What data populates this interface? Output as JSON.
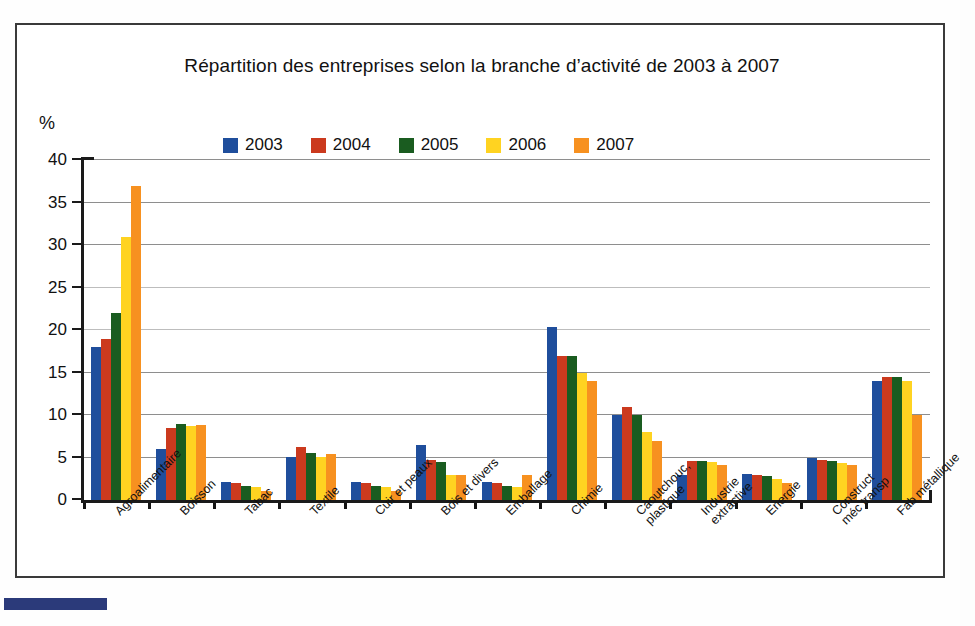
{
  "chart_data": {
    "type": "bar",
    "title": "Répartition des entreprises selon la branche d’activité de 2003 à 2007",
    "xlabel": "",
    "ylabel": "%",
    "ylim": [
      0,
      40
    ],
    "yticks": [
      0,
      5,
      10,
      15,
      20,
      25,
      30,
      35,
      40
    ],
    "grid": true,
    "legend_position": "top",
    "categories": [
      "Agroalimentaire",
      "Boisson",
      "Tabac",
      "Textile",
      "Cuir et peaux",
      "Bois et divers",
      "Emballage",
      "Chimie",
      "Caoutchouc,\nplastique",
      "Industrie\nextractive",
      "Energie",
      "Construct\nméc transp",
      "Fab métallique"
    ],
    "series": [
      {
        "name": "2003",
        "color": "#1F4E9C",
        "values": [
          18.0,
          6.0,
          2.1,
          5.1,
          2.1,
          6.5,
          2.1,
          20.3,
          10.0,
          3.0,
          3.1,
          5.0,
          14.0
        ]
      },
      {
        "name": "2004",
        "color": "#CB3A1E",
        "values": [
          19.0,
          8.5,
          2.0,
          6.2,
          2.0,
          4.7,
          2.0,
          17.0,
          11.0,
          4.6,
          3.0,
          4.7,
          14.5
        ]
      },
      {
        "name": "2005",
        "color": "#1A5C20",
        "values": [
          22.0,
          9.0,
          1.6,
          5.5,
          1.6,
          4.5,
          1.6,
          17.0,
          10.0,
          4.6,
          2.8,
          4.6,
          14.5
        ]
      },
      {
        "name": "2006",
        "color": "#FFD321",
        "values": [
          31.0,
          8.7,
          1.5,
          5.1,
          1.5,
          3.0,
          1.5,
          15.0,
          8.0,
          4.5,
          2.5,
          4.4,
          14.0
        ]
      },
      {
        "name": "2007",
        "color": "#F79120",
        "values": [
          37.0,
          8.8,
          1.1,
          5.4,
          1.1,
          2.9,
          3.0,
          14.0,
          7.0,
          4.1,
          2.0,
          4.1,
          10.0
        ]
      }
    ]
  },
  "legend": {
    "items": [
      {
        "label": "2003",
        "color": "#1F4E9C"
      },
      {
        "label": "2004",
        "color": "#CB3A1E"
      },
      {
        "label": "2005",
        "color": "#1A5C20"
      },
      {
        "label": "2006",
        "color": "#FFD321"
      },
      {
        "label": "2007",
        "color": "#F79120"
      }
    ]
  },
  "axis": {
    "y_unit": "%",
    "y_tick_labels": [
      "40",
      "35",
      "30",
      "25",
      "20",
      "15",
      "10",
      "5",
      "0"
    ]
  }
}
